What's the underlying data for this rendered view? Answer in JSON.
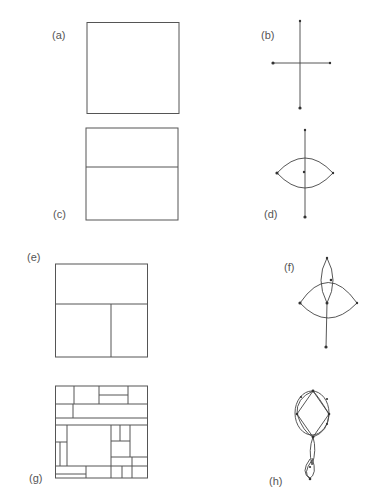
{
  "figure": {
    "panels": [
      {
        "id": "a",
        "label": "(a)",
        "kind": "rectangular-dissection",
        "description": "single square, no subdivisions"
      },
      {
        "id": "b",
        "label": "(b)",
        "kind": "dual-graph",
        "description": "cross of two edges with terminal nodes"
      },
      {
        "id": "c",
        "label": "(c)",
        "kind": "rectangular-dissection",
        "description": "square split by one horizontal line"
      },
      {
        "id": "d",
        "label": "(d)",
        "kind": "dual-graph",
        "description": "vertical edge crossed by a lens of two arcs"
      },
      {
        "id": "e",
        "label": "(e)",
        "kind": "rectangular-dissection",
        "description": "square split horizontally, bottom split vertically"
      },
      {
        "id": "f",
        "label": "(f)",
        "kind": "dual-graph",
        "description": "two overlapping lenses with a vertical tail"
      },
      {
        "id": "g",
        "label": "(g)",
        "kind": "rectangular-dissection",
        "description": "square dissected into many rectangles"
      },
      {
        "id": "h",
        "label": "(h)",
        "kind": "dual-graph",
        "description": "oval ring of lenses with a chain of lenses below"
      }
    ]
  }
}
